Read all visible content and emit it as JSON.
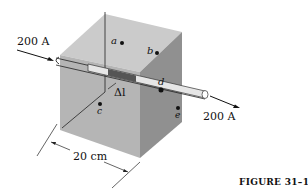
{
  "figure": {
    "caption": "FIGURE 31–15",
    "current_in": "200 A",
    "current_out": "200 A",
    "segment_label": "Δl",
    "dimension_label": "20 cm",
    "points": [
      {
        "label": "a"
      },
      {
        "label": "b"
      },
      {
        "label": "c"
      },
      {
        "label": "d"
      },
      {
        "label": "e"
      }
    ],
    "colors": {
      "top_face": "#c9c9c9",
      "left_face": "#b4b4b4",
      "right_face": "#8f8f8f",
      "segment": "#555555"
    }
  }
}
